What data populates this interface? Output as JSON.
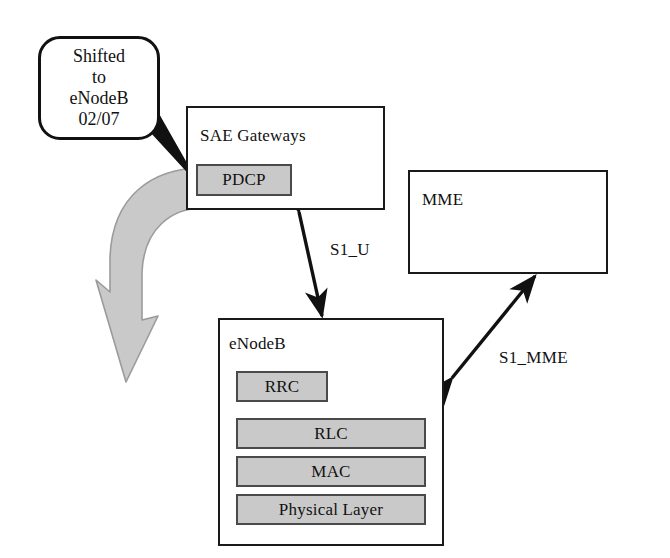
{
  "diagram": {
    "background_color": "#ffffff",
    "line_color": "#111111",
    "block_fill_color": "#c9c9c9",
    "curved_arrow_color": "#bdbdbd"
  },
  "callout": {
    "name": "shifted-note",
    "lines": [
      "Shifted",
      "to",
      "eNodeB",
      "02/07"
    ],
    "points_to": "PDCP"
  },
  "nodes": [
    {
      "id": "sae-gateways",
      "label": "SAE Gateways",
      "blocks": [
        {
          "id": "pdcp",
          "label": "PDCP"
        }
      ]
    },
    {
      "id": "mme",
      "label": "MME",
      "blocks": []
    },
    {
      "id": "enodeb",
      "label": "eNodeB",
      "blocks": [
        {
          "id": "rrc",
          "label": "RRC"
        },
        {
          "id": "rlc",
          "label": "RLC"
        },
        {
          "id": "mac",
          "label": "MAC"
        },
        {
          "id": "physical-layer",
          "label": "Physical Layer"
        }
      ]
    }
  ],
  "connections": [
    {
      "id": "s1-u",
      "label": "S1_U",
      "from": "sae-gateways",
      "to": "enodeb",
      "arrowheads": "both"
    },
    {
      "id": "s1-mme",
      "label": "S1_MME",
      "from": "enodeb",
      "to": "mme",
      "arrowheads": "both"
    }
  ],
  "annotations": {
    "migration_arrow": {
      "id": "migration-curved-arrow",
      "description": "curved block arrow from PDCP downward toward eNodeB"
    }
  }
}
